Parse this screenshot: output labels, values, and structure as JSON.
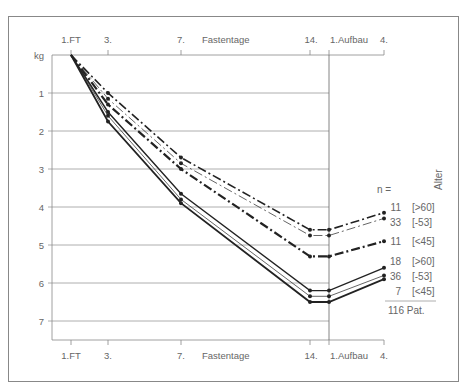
{
  "chart_data": {
    "type": "line",
    "title": "",
    "xlabel": "Fastentage",
    "ylabel": "kg",
    "x": [
      "1.FT",
      "3.",
      "7.",
      "14.",
      "1.Aufbau",
      "4."
    ],
    "x_ticks_top": [
      "1.FT",
      "3.",
      "7.",
      "Fastentage",
      "14.",
      "1.Aufbau",
      "4."
    ],
    "x_ticks_bottom": [
      "1.FT",
      "3.",
      "7.",
      "Fastentage",
      "14.",
      "1.Aufbau",
      "4."
    ],
    "y_ticks": [
      "kg",
      "1",
      "2",
      "3",
      "4",
      "5",
      "6",
      "7"
    ],
    "ylim": [
      0,
      7.5
    ],
    "y_inverted": true,
    "grid": true,
    "legend_position": "right",
    "legend_header": "n =",
    "legend_title": "Alter",
    "legend_total": "116 Pat.",
    "series": [
      {
        "name": "11 [>60]",
        "n": "11",
        "age": "[>60]",
        "style": "dash-dot-thin",
        "values": [
          0,
          1.0,
          2.7,
          4.6,
          4.6,
          4.15
        ]
      },
      {
        "name": "33 [-53]",
        "n": "33",
        "age": "[-53]",
        "style": "dash-dot-hairline",
        "values": [
          0,
          1.15,
          2.85,
          4.75,
          4.75,
          4.3
        ]
      },
      {
        "name": "11 [<45]",
        "n": "11",
        "age": "[<45]",
        "style": "dash-dot-heavy",
        "values": [
          0,
          1.3,
          3.0,
          5.3,
          5.3,
          4.9
        ]
      },
      {
        "name": "18 [>60]",
        "n": "18",
        "age": "[>60]",
        "style": "solid",
        "values": [
          0,
          1.5,
          3.65,
          6.2,
          6.2,
          5.6
        ]
      },
      {
        "name": "36 [-53]",
        "n": "36",
        "age": "[-53]",
        "style": "solid-thin",
        "values": [
          0,
          1.6,
          3.8,
          6.35,
          6.35,
          5.8
        ]
      },
      {
        "name": "7 [<45]",
        "n": "7",
        "age": "[<45]",
        "style": "solid-heavy",
        "values": [
          0,
          1.75,
          3.9,
          6.5,
          6.5,
          5.9
        ]
      }
    ]
  }
}
